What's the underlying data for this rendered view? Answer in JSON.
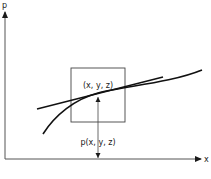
{
  "diagram": {
    "axes": {
      "y_label": "p",
      "x_label": "x"
    },
    "point_label": "(x, y, z)",
    "value_label": "p(x, y, z)",
    "elements": {
      "box": "square window around point",
      "tangent_line": "straight line tangent at point",
      "curve": "smooth curve through point",
      "arrow": "vertical double-headed arrow from x-axis to point"
    },
    "colors": {
      "ink": "#1a1a1a",
      "background": "#ffffff"
    }
  }
}
